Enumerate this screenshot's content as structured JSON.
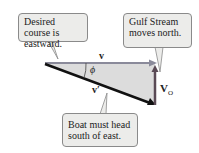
{
  "callouts": {
    "course": "Desired course is eastward.",
    "stream": "Gulf Stream moves north.",
    "boat": "Boat must head south of east."
  },
  "labels": {
    "v": "v",
    "v_prime": "v′",
    "phi": "ϕ",
    "v_o": "V",
    "v_o_sub": "O"
  },
  "colors": {
    "v_arrow": "#8a8a9a",
    "v_prime_arrow": "#111111",
    "v_o_arrow": "#5a4a55",
    "triangle_fill": "#dcdcdc",
    "callout_fill": "#ececea"
  }
}
